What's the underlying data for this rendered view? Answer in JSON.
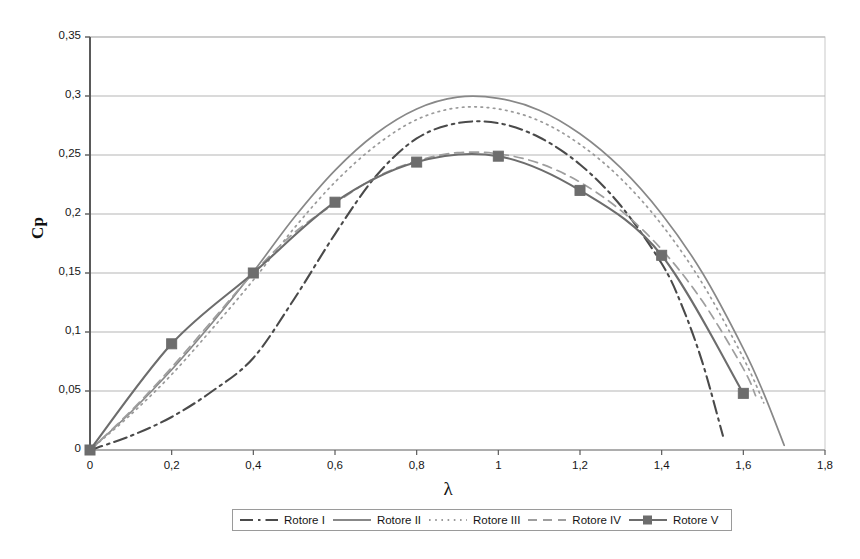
{
  "chart_data": {
    "type": "line",
    "title": "",
    "xlabel": "λ",
    "ylabel": "Cp",
    "xlim": [
      0,
      1.8
    ],
    "ylim": [
      0,
      0.35
    ],
    "xticks": [
      "0",
      "0,2",
      "0,4",
      "0,6",
      "0,8",
      "1",
      "1,2",
      "1,4",
      "1,6",
      "1,8"
    ],
    "xtick_values": [
      0,
      0.2,
      0.4,
      0.6,
      0.8,
      1.0,
      1.2,
      1.4,
      1.6,
      1.8
    ],
    "yticks": [
      "0",
      "0,05",
      "0,1",
      "0,15",
      "0,2",
      "0,25",
      "0,3",
      "0,35"
    ],
    "ytick_values": [
      0,
      0.05,
      0.1,
      0.15,
      0.2,
      0.25,
      0.3,
      0.35
    ],
    "grid": "horizontal",
    "legend_position": "bottom",
    "decimal_separator": ",",
    "series": [
      {
        "name": "Rotore I",
        "style": "dash-dot",
        "color": "#4a4a4a",
        "marker": "none",
        "x": [
          0,
          0.1,
          0.2,
          0.3,
          0.4,
          0.5,
          0.6,
          0.7,
          0.8,
          0.9,
          1.0,
          1.1,
          1.2,
          1.3,
          1.4,
          1.45,
          1.5,
          1.55
        ],
        "y": [
          0,
          0.012,
          0.028,
          0.05,
          0.078,
          0.128,
          0.183,
          0.232,
          0.264,
          0.277,
          0.277,
          0.265,
          0.242,
          0.207,
          0.158,
          0.122,
          0.074,
          0.012
        ]
      },
      {
        "name": "Rotore II",
        "style": "solid",
        "color": "#888888",
        "marker": "none",
        "x": [
          0,
          0.1,
          0.2,
          0.3,
          0.4,
          0.5,
          0.6,
          0.7,
          0.8,
          0.9,
          1.0,
          1.1,
          1.2,
          1.3,
          1.4,
          1.5,
          1.6,
          1.65,
          1.7
        ],
        "y": [
          0,
          0.032,
          0.068,
          0.108,
          0.151,
          0.197,
          0.237,
          0.268,
          0.289,
          0.299,
          0.298,
          0.288,
          0.268,
          0.239,
          0.2,
          0.15,
          0.086,
          0.048,
          0.004
        ]
      },
      {
        "name": "Rotore III",
        "style": "dotted",
        "color": "#9a9a9a",
        "marker": "none",
        "x": [
          0,
          0.1,
          0.2,
          0.3,
          0.4,
          0.5,
          0.6,
          0.7,
          0.8,
          0.9,
          1.0,
          1.1,
          1.2,
          1.3,
          1.4,
          1.5,
          1.6,
          1.65
        ],
        "y": [
          0,
          0.03,
          0.064,
          0.103,
          0.144,
          0.188,
          0.227,
          0.258,
          0.28,
          0.29,
          0.289,
          0.279,
          0.259,
          0.23,
          0.191,
          0.141,
          0.078,
          0.04
        ]
      },
      {
        "name": "Rotore IV",
        "style": "dashed",
        "color": "#9e9e9e",
        "marker": "none",
        "x": [
          0,
          0.1,
          0.2,
          0.3,
          0.4,
          0.5,
          0.6,
          0.7,
          0.8,
          0.9,
          1.0,
          1.1,
          1.2,
          1.3,
          1.4,
          1.5,
          1.6,
          1.63
        ],
        "y": [
          0,
          0.033,
          0.07,
          0.11,
          0.15,
          0.184,
          0.209,
          0.231,
          0.245,
          0.252,
          0.251,
          0.243,
          0.227,
          0.203,
          0.17,
          0.126,
          0.069,
          0.046
        ]
      },
      {
        "name": "Rotore V",
        "style": "solid-marker",
        "color": "#6d6d6d",
        "marker": "square",
        "x": [
          0,
          0.2,
          0.4,
          0.6,
          0.8,
          1.0,
          1.2,
          1.4,
          1.6
        ],
        "y": [
          0,
          0.09,
          0.15,
          0.21,
          0.244,
          0.249,
          0.22,
          0.165,
          0.048
        ]
      }
    ]
  },
  "legend": {
    "items": [
      {
        "label": "Rotore I"
      },
      {
        "label": "Rotore II"
      },
      {
        "label": "Rotore III"
      },
      {
        "label": "Rotore IV"
      },
      {
        "label": "Rotore V"
      }
    ]
  },
  "axes": {
    "x_title": "λ",
    "y_title": "Cp"
  }
}
